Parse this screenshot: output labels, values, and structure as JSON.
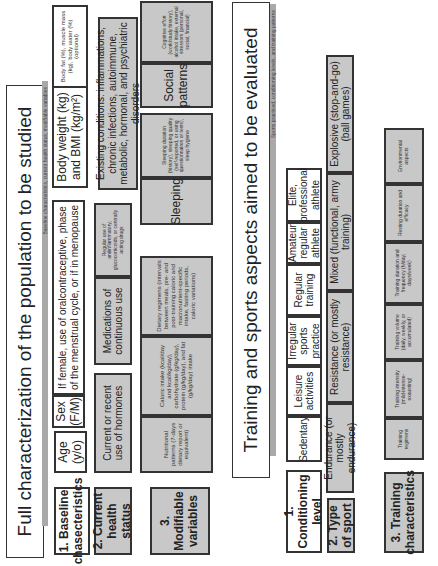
{
  "section1": {
    "title": "Full characterization of the population to be studied",
    "bar": "Baseline characteristics, current health status, modifiable variables",
    "rows": {
      "baseline": {
        "label": "1. Baseline chasecteristics",
        "cells": [
          "Age (y/o)",
          "Sex (F/M)",
          "If female, use of oralcontraceptive, phase of the menstrual cycle, or if in menopause",
          "Body weight (kg) and BMI (kg/m²)",
          "Body fat (%), muscle mass (kg), body water (%) (optional)"
        ]
      },
      "health": {
        "label": "2. Current health status",
        "cells": [
          "Current or recent use of hormones",
          "Medications of continuous use",
          "Regular use of antiinflammatory, glucocorticoids, or centrally acting drugs",
          "Existing conditions: inflammations, chronic infections, autoimmune, metabolic, hormonal, and psychiatric disorders"
        ]
      },
      "modifiable": {
        "label": "3. Modifiable variables",
        "cells": [
          "Nutritional patterns (7-days dietary report or equivalent)",
          "Caloric intake (kcal/day and kcal/kg/day), carbohydrate (g/kg/day), protein (g/kg/day), and fat (g/kg/day) intake",
          "Dietary regimens (intervals between meals, pre- and post-training caloric and macronutrient-specific intake, fasting periods, caloric variations)",
          "Sleeping",
          "Sleeping duration (history), sleeping quality (self-reported, or using questionnaires or tests), sleep hygiene",
          "Social patterns",
          "Cognitive effort (work/study history), alcohol intake, external stressors (personal, social, financial)"
        ]
      }
    }
  },
  "section2": {
    "title": "Training and sports aspects aimed to be evaluated",
    "bar": "Sports practiced, conditioning levels, and training patterns",
    "rows": {
      "conditioning": {
        "label": "1. Conditioning level",
        "cells": [
          "Sedentary",
          "Leisure activities",
          "Irregular sports practice",
          "Regular training",
          "Amateur regular athlete",
          "Elite, professional athlete"
        ]
      },
      "sport": {
        "label": "2. Type of sport",
        "cells": [
          "Endurance (or mostly endurance)",
          "Resistance (or mostly resistance)",
          "Mixed (functional, army training)",
          "Explosive (stop-and-go) (ball games)"
        ]
      },
      "training": {
        "label": "3. Training characteristics",
        "cells": [
          "Training regimens",
          "Training intensity (mild-intense-exausting)",
          "Training volume (daily, weekly, or accumulated)",
          "Training duration and frequency (h/day; days/week)",
          "Resting duration and efficacy",
          "Environmental aspects"
        ]
      }
    }
  },
  "colors": {
    "gray_fill": "#c8c8c8",
    "bar": "#a9a9a9",
    "border": "#333333"
  }
}
